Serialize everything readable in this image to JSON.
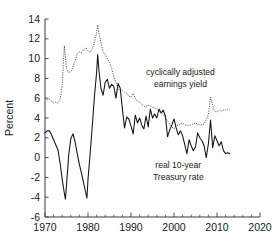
{
  "chart_data": {
    "type": "line",
    "title": "",
    "xlabel": "",
    "ylabel": "Percent",
    "xlim": [
      1970,
      2020
    ],
    "ylim": [
      -6,
      14
    ],
    "grid": false,
    "legend_position": "inline-annotations",
    "x_ticks": [
      1970,
      1980,
      1990,
      2000,
      2010,
      2020
    ],
    "x_tick_labels": [
      "1970",
      "1980",
      "1990",
      "2000",
      "2010",
      "2020"
    ],
    "x_minor_tick_step": 2,
    "y_ticks": [
      -6,
      -4,
      -2,
      0,
      2,
      4,
      6,
      8,
      10,
      12,
      14
    ],
    "y_tick_labels": [
      "-6",
      "-4",
      "-2",
      "0",
      "2",
      "4",
      "6",
      "8",
      "10",
      "12",
      "14"
    ],
    "annotations": [
      {
        "name": "cape-earnings-yield-label",
        "lines": [
          "cyclically adjusted",
          "earnings yield"
        ],
        "x": 2001.5,
        "y": 8.3
      },
      {
        "name": "real-treasury-rate-label",
        "lines": [
          "real 10-year",
          "Treasury rate"
        ],
        "x": 2001.0,
        "y": -1.1
      }
    ],
    "series": [
      {
        "name": "cyclically adjusted earnings yield",
        "style": "dotted",
        "color": "#555555",
        "x": [
          1970,
          1970.5,
          1971,
          1971.5,
          1972,
          1972.5,
          1973,
          1973.5,
          1974,
          1974.25,
          1974.5,
          1975,
          1975.5,
          1976,
          1976.5,
          1977,
          1977.5,
          1978,
          1978.5,
          1979,
          1979.5,
          1980,
          1980.5,
          1981,
          1981.5,
          1982,
          1982.25,
          1982.5,
          1983,
          1983.5,
          1984,
          1984.5,
          1985,
          1985.5,
          1986,
          1986.5,
          1987,
          1987.5,
          1988,
          1988.5,
          1989,
          1989.5,
          1990,
          1990.5,
          1991,
          1991.5,
          1992,
          1992.5,
          1993,
          1993.5,
          1994,
          1994.5,
          1995,
          1995.5,
          1996,
          1996.5,
          1997,
          1997.5,
          1998,
          1998.5,
          1999,
          1999.5,
          2000,
          2000.5,
          2001,
          2001.5,
          2002,
          2002.5,
          2003,
          2003.5,
          2004,
          2004.5,
          2005,
          2005.5,
          2006,
          2006.5,
          2007,
          2007.5,
          2008,
          2008.25,
          2008.5,
          2009,
          2009.25,
          2009.5,
          2010,
          2010.5,
          2011,
          2011.5,
          2012,
          2012.5,
          2013
        ],
        "y": [
          6.0,
          5.8,
          5.9,
          5.7,
          5.6,
          5.6,
          5.5,
          5.9,
          7.2,
          9.3,
          11.3,
          9.0,
          8.6,
          8.7,
          9.1,
          9.8,
          10.5,
          10.7,
          10.6,
          10.9,
          11.1,
          10.8,
          10.6,
          11.0,
          11.6,
          12.6,
          13.4,
          12.6,
          11.6,
          10.7,
          10.4,
          10.0,
          9.6,
          9.0,
          8.2,
          7.6,
          7.0,
          6.7,
          6.8,
          6.6,
          6.5,
          6.2,
          6.1,
          6.5,
          6.0,
          5.7,
          5.6,
          5.4,
          5.2,
          5.1,
          5.3,
          5.2,
          5.1,
          5.0,
          4.9,
          4.7,
          4.6,
          4.4,
          4.0,
          3.7,
          3.4,
          3.1,
          2.9,
          3.2,
          3.3,
          3.4,
          3.5,
          3.3,
          3.2,
          3.3,
          3.3,
          3.4,
          3.5,
          3.4,
          3.3,
          3.3,
          3.4,
          3.8,
          4.4,
          5.2,
          6.1,
          5.3,
          4.9,
          4.7,
          4.6,
          4.8,
          4.7,
          4.8,
          4.8,
          4.9,
          4.8
        ]
      },
      {
        "name": "real 10-year Treasury rate",
        "style": "solid",
        "color": "#111111",
        "x": [
          1970,
          1970.5,
          1971,
          1971.5,
          1972,
          1972.5,
          1973,
          1973.5,
          1974,
          1974.5,
          1974.75,
          1975,
          1975.5,
          1976,
          1976.5,
          1977,
          1977.5,
          1978,
          1978.5,
          1979,
          1979.5,
          1979.75,
          1980,
          1980.5,
          1981,
          1981.5,
          1982,
          1982.25,
          1982.5,
          1983,
          1983.5,
          1984,
          1984.5,
          1985,
          1985.5,
          1986,
          1986.5,
          1987,
          1987.5,
          1988,
          1988.5,
          1989,
          1989.5,
          1990,
          1990.5,
          1991,
          1991.5,
          1992,
          1992.5,
          1993,
          1993.5,
          1994,
          1994.5,
          1995,
          1995.5,
          1996,
          1996.5,
          1997,
          1997.5,
          1998,
          1998.5,
          1999,
          1999.5,
          2000,
          2000.5,
          2001,
          2001.5,
          2002,
          2002.5,
          2003,
          2003.5,
          2004,
          2004.5,
          2005,
          2005.5,
          2006,
          2006.5,
          2007,
          2007.5,
          2008,
          2008.5,
          2009,
          2009.5,
          2010,
          2010.5,
          2011,
          2011.5,
          2012,
          2012.5,
          2013
        ],
        "y": [
          2.5,
          2.7,
          2.7,
          2.3,
          1.8,
          1.3,
          0.8,
          -0.5,
          -2.2,
          -3.6,
          -4.2,
          -2.8,
          0.2,
          1.9,
          2.4,
          1.6,
          0.4,
          -0.7,
          -1.6,
          -2.6,
          -3.6,
          -4.1,
          -2.2,
          0.4,
          3.2,
          6.2,
          8.6,
          10.4,
          9.0,
          7.0,
          6.3,
          7.6,
          7.9,
          7.0,
          7.4,
          7.2,
          6.0,
          7.5,
          7.0,
          4.9,
          3.0,
          4.1,
          3.9,
          3.2,
          2.4,
          4.3,
          3.5,
          4.0,
          3.3,
          2.9,
          4.2,
          3.1,
          4.9,
          4.0,
          4.4,
          4.0,
          4.9,
          4.5,
          4.8,
          4.2,
          2.1,
          2.8,
          3.3,
          3.9,
          3.0,
          2.3,
          2.7,
          2.2,
          1.3,
          0.4,
          1.8,
          1.2,
          0.7,
          1.1,
          2.5,
          2.0,
          1.7,
          1.2,
          0.0,
          1.4,
          3.8,
          1.0,
          2.2,
          1.7,
          1.2,
          1.6,
          0.7,
          0.4,
          0.5,
          0.4
        ]
      }
    ]
  }
}
